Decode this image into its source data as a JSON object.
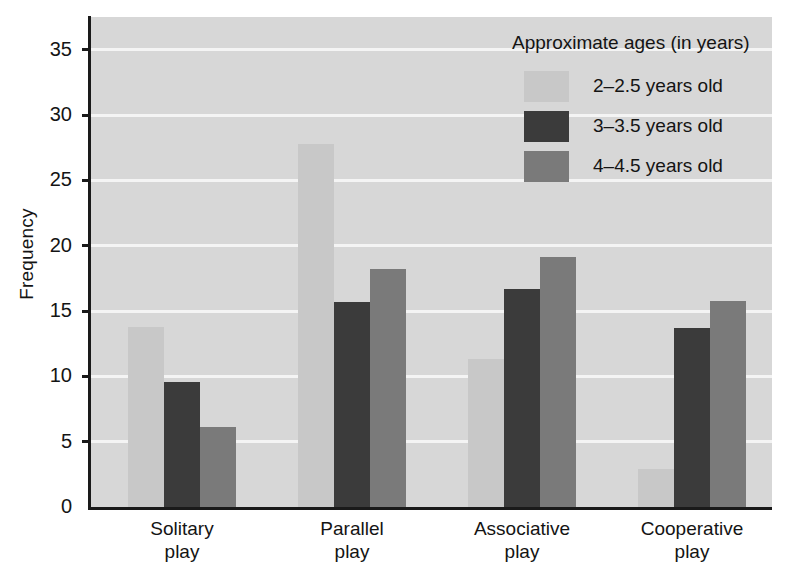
{
  "chart_data": {
    "type": "bar",
    "title": "",
    "xlabel": "",
    "ylabel": "Frequency",
    "ylim": [
      0,
      37.5
    ],
    "yticks": [
      0,
      5,
      10,
      15,
      20,
      25,
      30,
      35
    ],
    "grid": true,
    "legend_position": "top-right",
    "legend_title": "Approximate ages (in years)",
    "categories": [
      "Solitary\nplay",
      "Parallel\nplay",
      "Associative\nplay",
      "Cooperative\nplay"
    ],
    "series": [
      {
        "name": "2–2.5 years old",
        "color": "#c8c8c8",
        "values": [
          13.8,
          27.8,
          11.3,
          2.9
        ]
      },
      {
        "name": "3–3.5 years old",
        "color": "#3b3b3b",
        "values": [
          9.6,
          15.7,
          16.7,
          13.7
        ]
      },
      {
        "name": "4–4.5 years old",
        "color": "#7a7a7a",
        "values": [
          6.1,
          18.2,
          19.1,
          15.8
        ]
      }
    ]
  },
  "axis": {
    "y_title": "Frequency",
    "y_tick_labels": [
      "35",
      "30",
      "25",
      "20",
      "15",
      "10",
      "5",
      "0"
    ]
  },
  "colors": {
    "plot_background": "#d7d7d7",
    "gridline": "#f4f4f4",
    "axis": "#1a1a1a",
    "series_light": "#c8c8c8",
    "series_dark": "#3b3b3b",
    "series_medium": "#7a7a7a"
  }
}
